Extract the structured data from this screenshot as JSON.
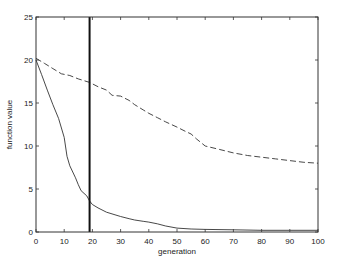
{
  "chart_data": {
    "type": "line",
    "title": "",
    "xlabel": "generation",
    "ylabel": "function value",
    "xlim": [
      0,
      100
    ],
    "ylim": [
      0,
      25
    ],
    "x_ticks": [
      0,
      10,
      20,
      30,
      40,
      50,
      60,
      70,
      80,
      90,
      100
    ],
    "y_ticks": [
      0,
      5,
      10,
      15,
      20,
      25
    ],
    "grid": false,
    "legend": null,
    "series": [
      {
        "name": "solid",
        "style": "solid",
        "color": "#333333",
        "x": [
          0,
          2,
          4,
          6,
          8,
          10,
          11,
          12,
          14,
          15,
          16,
          18,
          19,
          20,
          22,
          25,
          28,
          30,
          33,
          35,
          38,
          40,
          43,
          46,
          50,
          55,
          60,
          70,
          80,
          90,
          100
        ],
        "y": [
          20.0,
          18.3,
          16.5,
          14.8,
          13.2,
          11.0,
          8.8,
          7.7,
          6.3,
          5.5,
          4.8,
          4.2,
          3.6,
          3.2,
          2.8,
          2.3,
          2.0,
          1.8,
          1.55,
          1.4,
          1.25,
          1.15,
          0.95,
          0.7,
          0.45,
          0.35,
          0.3,
          0.25,
          0.2,
          0.2,
          0.2
        ]
      },
      {
        "name": "dashed",
        "style": "dashed",
        "color": "#333333",
        "x": [
          0,
          3,
          6,
          9,
          12,
          15,
          19,
          22,
          25,
          27,
          30,
          33,
          35,
          38,
          40,
          43,
          46,
          50,
          53,
          55,
          57,
          60,
          65,
          70,
          75,
          80,
          85,
          90,
          95,
          100
        ],
        "y": [
          20.2,
          19.6,
          19.0,
          18.4,
          18.2,
          17.8,
          17.4,
          16.9,
          16.5,
          15.9,
          15.8,
          15.3,
          14.8,
          14.2,
          13.8,
          13.3,
          12.8,
          12.2,
          11.7,
          11.4,
          10.8,
          10.0,
          9.6,
          9.2,
          8.9,
          8.7,
          8.5,
          8.3,
          8.1,
          8.0
        ]
      }
    ],
    "annotations": [
      {
        "type": "vertical_line",
        "x": 19,
        "style": "solid-thick",
        "color": "#111111"
      }
    ]
  }
}
